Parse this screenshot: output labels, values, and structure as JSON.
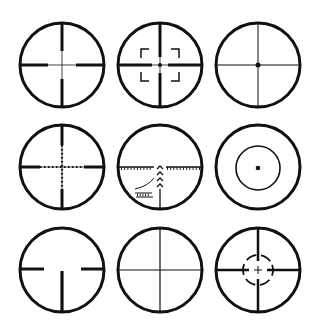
{
  "figure": {
    "background": "#ffffff",
    "stroke_color": "#111111"
  },
  "reticles": [
    {
      "id": 1,
      "name": "duplex",
      "label": "Duplex crosshair with thick outer posts"
    },
    {
      "id": 2,
      "name": "duplex-with-brackets",
      "label": "Duplex with center dot and corner bracket frame"
    },
    {
      "id": 3,
      "name": "fine-crosshair-dot",
      "label": "Fine crosshair with center dot"
    },
    {
      "id": 4,
      "name": "mil-dot-duplex",
      "label": "Duplex with dotted center section"
    },
    {
      "id": 5,
      "name": "ballistic-rangefinder",
      "label": "Ballistic reticle with chevrons, hash marks and rangefinding curve"
    },
    {
      "id": 6,
      "name": "circle-dot",
      "label": "Inner circle with center dot"
    },
    {
      "id": 7,
      "name": "german-post",
      "label": "German #1 post with horizontal bars"
    },
    {
      "id": 8,
      "name": "simple-crosshair",
      "label": "Simple thin crosshair"
    },
    {
      "id": 9,
      "name": "target-dashed-circle",
      "label": "Crosshair with dashed inner circle and center cross"
    }
  ]
}
